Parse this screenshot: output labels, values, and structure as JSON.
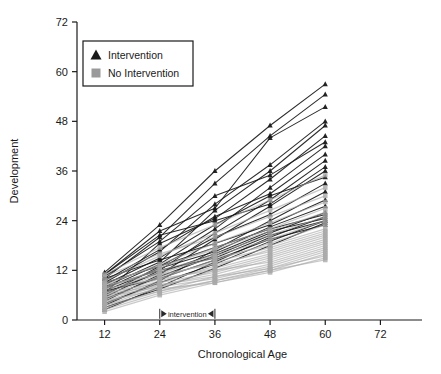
{
  "chart_data": {
    "type": "line",
    "title": "",
    "xlabel": "Chronological Age",
    "ylabel": "Development",
    "xlim": [
      6,
      78
    ],
    "ylim": [
      0,
      72
    ],
    "xticks": [
      12,
      24,
      36,
      48,
      60,
      72
    ],
    "yticks": [
      0,
      12,
      24,
      36,
      48,
      60,
      72
    ],
    "xticklabels": [
      "12",
      "24",
      "36",
      "48",
      "60",
      "72"
    ],
    "yticklabels": [
      "0",
      "12",
      "24",
      "36",
      "48",
      "60",
      "72"
    ],
    "grid": false,
    "legend_position": "upper left",
    "x": [
      12,
      24,
      36,
      48,
      60
    ],
    "annotations": [
      {
        "text": "intervention",
        "x_start": 24,
        "x_end": 36,
        "y": 1.5,
        "style": "double-headed-arrow-with-end-caps"
      }
    ],
    "legend": [
      {
        "name": "Intervention",
        "marker": "triangle",
        "color": "#1a1a1a"
      },
      {
        "name": "No Intervention",
        "marker": "square",
        "color": "#9a9a9a"
      }
    ],
    "series": [
      {
        "group": "Intervention",
        "color": "#1a1a1a",
        "marker": "triangle",
        "lines": [
          {
            "values": [
              11.5,
              23.0,
              36.0,
              47.0,
              57.0
            ]
          },
          {
            "values": [
              10.0,
              20.0,
              33.0,
              44.5,
              54.5
            ]
          },
          {
            "values": [
              11.0,
              21.5,
              27.0,
              44.0,
              51.5
            ]
          },
          {
            "values": [
              9.0,
              16.5,
              28.0,
              37.5,
              48.0
            ]
          },
          {
            "values": [
              8.0,
              14.0,
              26.5,
              36.0,
              47.0
            ]
          },
          {
            "values": [
              6.5,
              18.5,
              24.5,
              34.0,
              44.5
            ]
          },
          {
            "values": [
              10.5,
              19.0,
              30.0,
              35.0,
              43.0
            ]
          },
          {
            "values": [
              7.5,
              13.5,
              22.0,
              32.0,
              42.0
            ]
          },
          {
            "values": [
              9.5,
              17.0,
              25.0,
              30.5,
              40.0
            ]
          },
          {
            "values": [
              5.5,
              12.0,
              21.0,
              29.0,
              38.5
            ]
          },
          {
            "values": [
              11.0,
              20.5,
              24.0,
              28.0,
              37.0
            ]
          },
          {
            "values": [
              4.5,
              11.0,
              19.5,
              27.5,
              36.0
            ]
          },
          {
            "values": [
              8.5,
              15.0,
              23.0,
              30.0,
              34.5
            ]
          },
          {
            "values": [
              6.0,
              13.0,
              20.0,
              25.5,
              33.0
            ]
          },
          {
            "values": [
              3.5,
              9.5,
              17.0,
              24.0,
              31.0
            ]
          },
          {
            "values": [
              10.0,
              14.5,
              18.5,
              23.0,
              29.0
            ]
          },
          {
            "values": [
              7.0,
              12.5,
              16.5,
              22.5,
              27.5
            ]
          },
          {
            "values": [
              5.0,
              10.5,
              15.5,
              21.0,
              26.0
            ]
          },
          {
            "values": [
              9.0,
              13.0,
              17.5,
              22.0,
              25.5
            ]
          },
          {
            "values": [
              2.5,
              8.0,
              14.0,
              20.0,
              25.0
            ]
          },
          {
            "values": [
              6.5,
              11.5,
              16.0,
              21.5,
              24.5
            ]
          },
          {
            "values": [
              4.0,
              9.0,
              13.5,
              19.0,
              24.0
            ]
          },
          {
            "values": [
              8.0,
              12.0,
              15.0,
              20.5,
              24.0
            ]
          },
          {
            "values": [
              3.0,
              7.5,
              12.5,
              18.0,
              23.5
            ]
          },
          {
            "values": [
              7.0,
              10.0,
              14.5,
              19.5,
              23.0
            ]
          }
        ]
      },
      {
        "group": "No Intervention",
        "color": "#a8a8a8",
        "marker": "square",
        "lines": [
          {
            "values": [
              11.0,
              17.5,
              23.0,
              29.0,
              35.0
            ]
          },
          {
            "values": [
              9.5,
              15.5,
              21.0,
              26.5,
              32.0
            ]
          },
          {
            "values": [
              10.5,
              16.0,
              20.0,
              25.0,
              30.0
            ]
          },
          {
            "values": [
              8.5,
              13.5,
              18.5,
              23.5,
              28.5
            ]
          },
          {
            "values": [
              7.5,
              12.5,
              17.5,
              22.0,
              27.0
            ]
          },
          {
            "values": [
              9.0,
              13.0,
              17.0,
              21.5,
              26.0
            ]
          },
          {
            "values": [
              6.5,
              11.0,
              16.0,
              20.5,
              25.0
            ]
          },
          {
            "values": [
              8.0,
              12.0,
              15.5,
              19.5,
              24.0
            ]
          },
          {
            "values": [
              5.5,
              10.0,
              14.5,
              18.5,
              23.0
            ]
          },
          {
            "values": [
              7.0,
              11.5,
              15.0,
              18.0,
              22.0
            ]
          },
          {
            "values": [
              6.0,
              10.5,
              14.0,
              17.5,
              21.5
            ]
          },
          {
            "values": [
              4.5,
              9.0,
              13.0,
              17.0,
              21.0
            ]
          },
          {
            "values": [
              8.5,
              11.0,
              13.5,
              16.5,
              20.5
            ]
          },
          {
            "values": [
              5.0,
              9.5,
              12.5,
              16.0,
              20.0
            ]
          },
          {
            "values": [
              3.5,
              8.0,
              12.0,
              15.5,
              19.5
            ]
          },
          {
            "values": [
              6.5,
              9.0,
              11.5,
              15.0,
              19.0
            ]
          },
          {
            "values": [
              4.0,
              8.5,
              11.0,
              14.5,
              18.5
            ]
          },
          {
            "values": [
              7.5,
              10.0,
              12.0,
              14.0,
              18.0
            ]
          },
          {
            "values": [
              3.0,
              7.0,
              10.5,
              13.5,
              17.5
            ]
          },
          {
            "values": [
              5.5,
              8.0,
              10.0,
              13.0,
              17.0
            ]
          },
          {
            "values": [
              2.5,
              6.5,
              9.5,
              12.5,
              16.5
            ]
          },
          {
            "values": [
              4.5,
              7.5,
              9.0,
              12.0,
              16.0
            ]
          },
          {
            "values": [
              6.0,
              8.5,
              10.5,
              12.5,
              15.5
            ]
          },
          {
            "values": [
              2.0,
              6.0,
              9.0,
              11.5,
              15.0
            ]
          },
          {
            "values": [
              3.5,
              7.0,
              9.5,
              12.0,
              14.5
            ]
          }
        ]
      }
    ]
  }
}
